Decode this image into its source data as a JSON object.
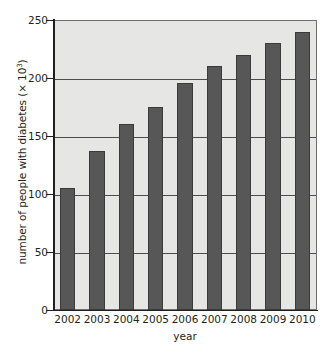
{
  "chart_data": {
    "type": "bar",
    "title": "",
    "subtitle": "",
    "xlabel": "year",
    "ylabel": "number of people with diabetes (× 10³)",
    "ylabel_prefix": "number of people with diabetes (× 10",
    "ylabel_exponent": "3",
    "ylabel_suffix": ")",
    "categories": [
      "2002",
      "2003",
      "2004",
      "2005",
      "2006",
      "2007",
      "2008",
      "2009",
      "2010"
    ],
    "values": [
      105,
      137,
      160,
      175,
      196,
      210,
      220,
      230,
      240
    ],
    "ylim": [
      0,
      250
    ],
    "ytick_labels": [
      "0",
      "50",
      "100",
      "150",
      "200",
      "250"
    ],
    "ytick_values": [
      0,
      50,
      100,
      150,
      200,
      250
    ],
    "grid": "horizontal",
    "legend": "none",
    "bar_color": "#575757",
    "bar_edge_color": "#3a3a3a",
    "plot_background_color": "#e6e6e4",
    "axis_color": "#231f20",
    "gridline_color": "#4c4c4c",
    "units_note": "values are in thousands (× 10³)"
  }
}
